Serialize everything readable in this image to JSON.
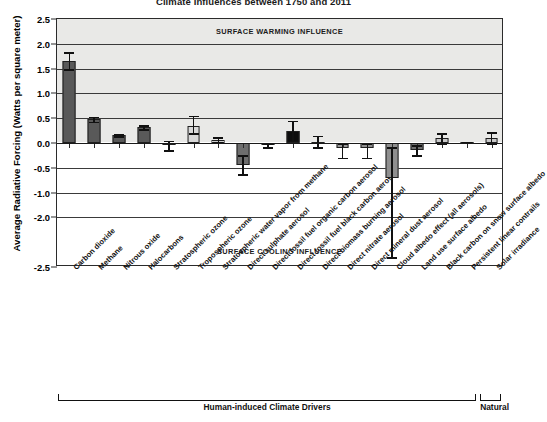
{
  "chart_data": {
    "type": "bar",
    "title": "Climate Influences between 1750 and 2011",
    "xlabel": "",
    "ylabel": "Average Radiative Forcing (Watts per square meter)",
    "ylim": [
      -2.5,
      2.5
    ],
    "ytick_labels": [
      "2.5",
      "2.0",
      "1.5",
      "1.0",
      "0.5",
      "0.0",
      "-0.5",
      "-1.0",
      "-2.0",
      "-2.5"
    ],
    "ytick_values": [
      2.5,
      2.0,
      1.5,
      1.0,
      0.5,
      0.0,
      -0.5,
      -1.0,
      -1.5,
      -2.5
    ],
    "grid": true,
    "legend": "none",
    "categories": [
      "Carbon dioxide",
      "Methane",
      "Nitrous oxide",
      "Halocarbons",
      "Stratospheric ozone",
      "Tropospheric ozone",
      "Stratospheric water vapor from methane",
      "Direct sulphate aerosol",
      "Direct fossil fuel organic carbon aerosol",
      "Direct fossil fuel black carbon aerosol",
      "Direct biomass burning aerosol",
      "Direct nitrate aerosol",
      "Direct mineral dust aerosol",
      "Cloud albedo effect (all aerosols)",
      "Land use surface albedo",
      "Black carbon on snow surface albedo",
      "Persistent linear contrails",
      "Solar irradiance"
    ],
    "values": [
      1.66,
      0.48,
      0.16,
      0.32,
      -0.05,
      0.35,
      0.07,
      -0.45,
      -0.05,
      0.25,
      0.03,
      -0.1,
      -0.1,
      -0.7,
      -0.15,
      0.1,
      0.02,
      0.1
    ],
    "err_low": [
      1.49,
      0.43,
      0.14,
      0.28,
      -0.15,
      0.2,
      0.02,
      -0.63,
      -0.09,
      0.05,
      -0.09,
      -0.3,
      -0.3,
      -2.3,
      -0.25,
      0.0,
      0.01,
      0.0
    ],
    "err_high": [
      1.83,
      0.53,
      0.18,
      0.36,
      0.05,
      0.55,
      0.12,
      -0.25,
      0.0,
      0.45,
      0.15,
      0.0,
      0.0,
      -0.08,
      -0.05,
      0.2,
      0.03,
      0.22
    ],
    "bar_shades": [
      "#595959",
      "#595959",
      "#595959",
      "#595959",
      "#8a8a8a",
      "#d8d8d8",
      "#cfcfcf",
      "#6e6e6e",
      "#b5b5b5",
      "#0d0d0d",
      "#a8a8a8",
      "#9a9a9a",
      "#8f8f8f",
      "#8f8f8f",
      "#6e6e6e",
      "#c9c9c9",
      "#6e6e6e",
      "#c9c9c9"
    ],
    "annotations": {
      "warming": "SURFACE WARMING INFLUENCE",
      "cooling": "SURFACE COOLING INFLUENCE"
    },
    "groups": [
      {
        "label": "Human-induced Climate Drivers",
        "start": 0,
        "end": 16
      },
      {
        "label": "Natural",
        "start": 17,
        "end": 17
      }
    ],
    "colors": {
      "band_warm": "#e9e9e7",
      "band_cool": "#ffffff",
      "axis": "#2b2b2b",
      "grid": "#3a3a3a"
    }
  }
}
